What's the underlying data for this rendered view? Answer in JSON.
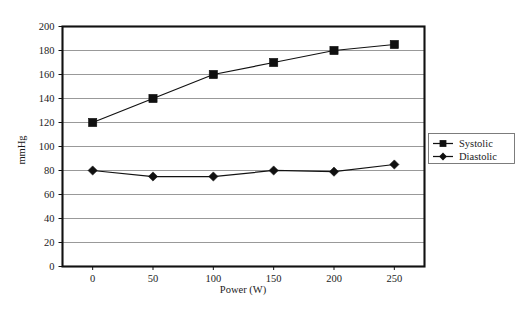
{
  "chart_data": {
    "type": "line",
    "title": "",
    "xlabel": "Power (W)",
    "ylabel": "mmHg",
    "x": [
      0,
      50,
      100,
      150,
      200,
      250
    ],
    "xtick_labels": [
      "0",
      "50",
      "100",
      "150",
      "200",
      "250"
    ],
    "ytick_labels": [
      "0",
      "20",
      "40",
      "60",
      "80",
      "100",
      "120",
      "140",
      "160",
      "180",
      "200"
    ],
    "yticks": [
      0,
      20,
      40,
      60,
      80,
      100,
      120,
      140,
      160,
      180,
      200
    ],
    "xlim": [
      -25,
      275
    ],
    "ylim": [
      0,
      200
    ],
    "grid": "horizontal",
    "legend_position": "right-outside",
    "series": [
      {
        "name": "Systolic",
        "marker": "square",
        "color": "#101010",
        "values": [
          120,
          140,
          160,
          170,
          180,
          185
        ]
      },
      {
        "name": "Diastolic",
        "marker": "diamond",
        "color": "#101010",
        "values": [
          80,
          75,
          75,
          80,
          79,
          85
        ]
      }
    ]
  },
  "legend": {
    "entries": [
      {
        "label": "Systolic"
      },
      {
        "label": "Diastolic"
      }
    ]
  },
  "axes": {
    "x_title": "Power (W)",
    "y_title": "mmHg"
  }
}
